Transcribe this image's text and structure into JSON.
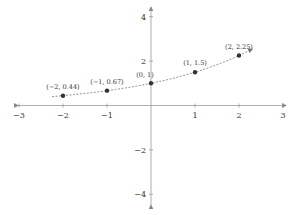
{
  "chart_data": {
    "type": "line",
    "title": "",
    "xlabel": "",
    "ylabel": "",
    "xlim": [
      -3,
      3
    ],
    "ylim": [
      -4,
      4
    ],
    "grid": false,
    "x_ticks": [
      -3,
      -2,
      -1,
      1,
      2,
      3
    ],
    "y_ticks": [
      4,
      2,
      -2,
      -4
    ],
    "x_tick_labels": [
      "−3",
      "−2",
      "−1",
      "1",
      "2",
      "3"
    ],
    "y_tick_labels": [
      "4",
      "2",
      "−2",
      "−4"
    ],
    "series": [
      {
        "name": "exponential curve",
        "function": "y = 1.5^x",
        "domain": [
          -2.25,
          2.3
        ],
        "style": "dashed",
        "color": "#555555",
        "points": [
          {
            "x": -2,
            "y": 0.44,
            "label": "(−2, 0.44)"
          },
          {
            "x": -1,
            "y": 0.67,
            "label": "(−1, 0.67)"
          },
          {
            "x": 0,
            "y": 1,
            "label": "(0, 1)"
          },
          {
            "x": 1,
            "y": 1.5,
            "label": "(1, 1.5)"
          },
          {
            "x": 2,
            "y": 2.25,
            "label": "(2, 2.25)"
          }
        ]
      }
    ],
    "legend": null
  },
  "colors": {
    "axis": "#888888",
    "curve": "#666666",
    "point": "#333333",
    "text": "#333333"
  }
}
